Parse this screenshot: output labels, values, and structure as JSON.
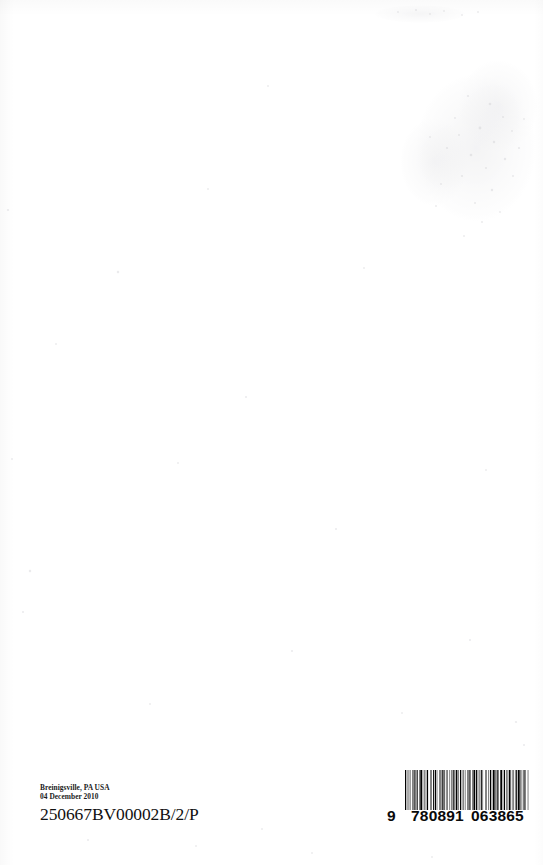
{
  "page": {
    "kind": "scanned-book-back-cover",
    "background_color": "#ffffff",
    "ink_color": "#111111"
  },
  "imprint": {
    "location_line": "Breinigsville, PA USA",
    "date_line": "04 December 2010",
    "print_code": "250667BV00002B/2/P"
  },
  "barcode": {
    "symbology": "EAN-13",
    "lead_digit": "9",
    "left_group": "780891",
    "right_group": "063865",
    "full_number": "9780891063865",
    "bar_color": "#000000",
    "pattern": [
      2,
      1,
      1,
      2,
      1,
      1,
      1,
      3,
      1,
      1,
      2,
      1,
      1,
      1,
      2,
      2,
      1,
      1,
      3,
      1,
      1,
      2,
      1,
      1,
      1,
      1,
      2,
      3,
      1,
      1,
      1,
      2,
      2,
      1,
      2,
      1,
      1,
      3,
      1,
      1,
      1,
      1,
      2,
      1,
      2,
      2,
      1,
      1,
      1,
      3,
      1,
      2,
      1,
      1,
      2,
      1,
      1,
      1,
      3,
      1,
      1,
      2,
      2,
      1,
      1,
      1,
      1,
      2,
      1,
      3,
      1,
      1,
      2,
      1,
      1,
      2,
      1,
      1,
      3,
      1,
      2,
      1,
      1,
      1,
      1,
      2,
      2,
      1,
      1,
      3,
      1,
      1,
      1,
      2,
      1,
      2,
      2,
      1,
      1,
      1,
      3,
      1,
      1,
      1,
      2,
      1,
      1,
      2,
      3,
      1,
      1,
      1,
      2,
      2,
      1,
      1,
      1,
      1,
      3,
      2,
      1,
      1,
      1,
      2,
      1,
      1,
      2,
      1,
      3,
      1,
      1,
      1,
      1,
      2,
      2,
      1,
      1,
      3,
      1,
      1
    ]
  },
  "artifacts": {
    "smudge_label": "scan-smudge",
    "speck_label": "dust-specks"
  }
}
